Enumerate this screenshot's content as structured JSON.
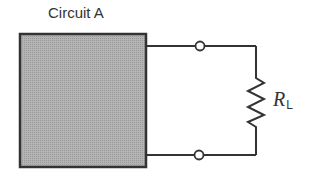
{
  "diagram": {
    "title": "Circuit A",
    "block": {
      "label": "Circuit A",
      "fill": "#a8a8a8",
      "stroke": "#333333"
    },
    "load": {
      "symbol": "R",
      "subscript": "L",
      "type": "resistor"
    },
    "terminals": [
      {
        "name": "top-terminal"
      },
      {
        "name": "bottom-terminal"
      }
    ],
    "colors": {
      "wire": "#333333",
      "block_fill": "#a8a8a8"
    }
  }
}
